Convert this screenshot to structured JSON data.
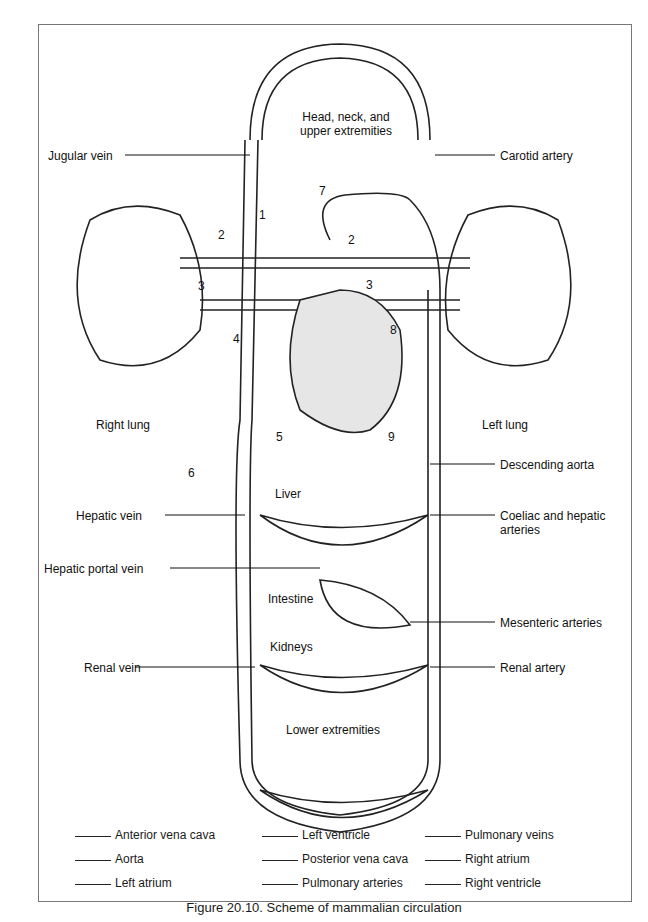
{
  "organs": {
    "head": "Head, neck, and\nupper extremities",
    "right_lung": "Right lung",
    "left_lung": "Left lung",
    "liver": "Liver",
    "intestine": "Intestine",
    "kidneys": "Kidneys",
    "lower": "Lower extremities"
  },
  "vessels": {
    "jugular": "Jugular vein",
    "carotid": "Carotid artery",
    "desc_aorta": "Descending aorta",
    "hepatic_vein": "Hepatic vein",
    "coeliac": "Coeliac and hepatic\narteries",
    "hepatic_portal": "Hepatic portal vein",
    "mesenteric": "Mesenteric arteries",
    "renal_vein": "Renal vein",
    "renal_artery": "Renal artery"
  },
  "numbers": [
    "1",
    "2",
    "2",
    "3",
    "3",
    "4",
    "5",
    "6",
    "7",
    "8",
    "9"
  ],
  "key": [
    [
      "Anterior vena cava",
      "Left ventricle",
      "Pulmonary veins"
    ],
    [
      "Aorta",
      "Posterior vena cava",
      "Right atrium"
    ],
    [
      "Left atrium",
      "Pulmonary arteries",
      "Right ventricle"
    ]
  ],
  "caption": "Figure 20.10. Scheme of mammalian circulation"
}
